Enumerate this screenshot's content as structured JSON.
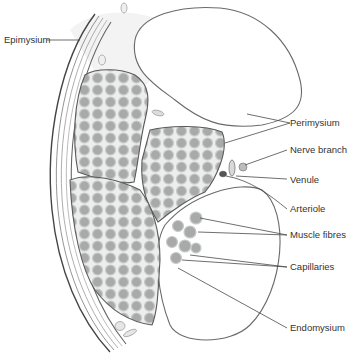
{
  "diagram": {
    "labels": {
      "epimysium": "Epimysium",
      "perimysium": "Perimysium",
      "nerve_branch": "Nerve branch",
      "venule": "Venule",
      "arteriole": "Arteriole",
      "muscle_fibres": "Muscle fibres",
      "capillaries": "Capillaries",
      "endomysium": "Endomysium"
    },
    "colors": {
      "outline": "#5a5a5a",
      "fibre": "#a8aaa9",
      "connective_tissue": "#e9ebea",
      "label_text": "#333333"
    }
  }
}
